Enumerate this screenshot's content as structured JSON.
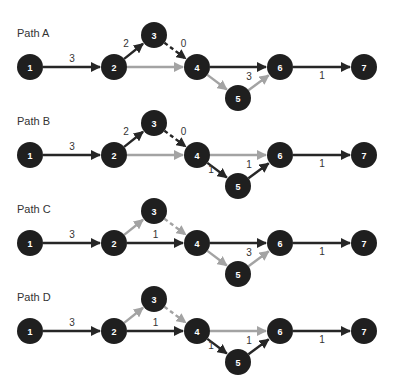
{
  "colors": {
    "node_fill": "#1f1f1f",
    "dark_edge": "#262626",
    "gray_edge": "#a3a3a3",
    "text": "#333333",
    "node_text": "#ffffff"
  },
  "layout": {
    "node_x": {
      "1": 30,
      "2": 114,
      "3": 154,
      "4": 197,
      "5": 238,
      "6": 280,
      "7": 364
    },
    "node_radius": 13,
    "panel_offsets": [
      0,
      88,
      176,
      264
    ],
    "main_row_y": 67,
    "upper_y": 35,
    "lower_y": 98,
    "title_x": 17,
    "title_y": 37
  },
  "panels": [
    {
      "title": "Path A",
      "nodes": [
        "1",
        "2",
        "3",
        "4",
        "5",
        "6",
        "7"
      ],
      "edges": [
        {
          "from": "1",
          "to": "2",
          "label": "3",
          "style": "dark",
          "label_pos": "above"
        },
        {
          "from": "2",
          "to": "3",
          "label": "2",
          "style": "dark",
          "label_pos": "left"
        },
        {
          "from": "3",
          "to": "4",
          "label": "0",
          "style": "dark-dashed",
          "label_pos": "right"
        },
        {
          "from": "2",
          "to": "4",
          "label": "",
          "style": "gray"
        },
        {
          "from": "4",
          "to": "6",
          "label": "",
          "style": "dark"
        },
        {
          "from": "4",
          "to": "5",
          "label": "",
          "style": "gray"
        },
        {
          "from": "5",
          "to": "6",
          "label": "3",
          "style": "gray",
          "label_pos": "left"
        },
        {
          "from": "6",
          "to": "7",
          "label": "1",
          "style": "dark",
          "label_pos": "below"
        }
      ]
    },
    {
      "title": "Path B",
      "nodes": [
        "1",
        "2",
        "3",
        "4",
        "5",
        "6",
        "7"
      ],
      "edges": [
        {
          "from": "1",
          "to": "2",
          "label": "3",
          "style": "dark",
          "label_pos": "above"
        },
        {
          "from": "2",
          "to": "3",
          "label": "2",
          "style": "dark",
          "label_pos": "left"
        },
        {
          "from": "3",
          "to": "4",
          "label": "0",
          "style": "dark-dashed",
          "label_pos": "right"
        },
        {
          "from": "2",
          "to": "4",
          "label": "",
          "style": "gray"
        },
        {
          "from": "4",
          "to": "6",
          "label": "",
          "style": "gray"
        },
        {
          "from": "4",
          "to": "5",
          "label": "1",
          "style": "dark",
          "label_pos": "right"
        },
        {
          "from": "5",
          "to": "6",
          "label": "1",
          "style": "dark",
          "label_pos": "left"
        },
        {
          "from": "6",
          "to": "7",
          "label": "1",
          "style": "dark",
          "label_pos": "below"
        }
      ]
    },
    {
      "title": "Path C",
      "nodes": [
        "1",
        "2",
        "3",
        "4",
        "5",
        "6",
        "7"
      ],
      "edges": [
        {
          "from": "1",
          "to": "2",
          "label": "3",
          "style": "dark",
          "label_pos": "above"
        },
        {
          "from": "2",
          "to": "3",
          "label": "",
          "style": "gray"
        },
        {
          "from": "3",
          "to": "4",
          "label": "",
          "style": "gray-dashed"
        },
        {
          "from": "2",
          "to": "4",
          "label": "1",
          "style": "dark",
          "label_pos": "above"
        },
        {
          "from": "4",
          "to": "6",
          "label": "",
          "style": "dark"
        },
        {
          "from": "4",
          "to": "5",
          "label": "",
          "style": "gray"
        },
        {
          "from": "5",
          "to": "6",
          "label": "3",
          "style": "gray",
          "label_pos": "left"
        },
        {
          "from": "6",
          "to": "7",
          "label": "1",
          "style": "dark",
          "label_pos": "below"
        }
      ]
    },
    {
      "title": "Path D",
      "nodes": [
        "1",
        "2",
        "3",
        "4",
        "5",
        "6",
        "7"
      ],
      "edges": [
        {
          "from": "1",
          "to": "2",
          "label": "3",
          "style": "dark",
          "label_pos": "above"
        },
        {
          "from": "2",
          "to": "3",
          "label": "",
          "style": "gray"
        },
        {
          "from": "3",
          "to": "4",
          "label": "",
          "style": "gray-dashed"
        },
        {
          "from": "2",
          "to": "4",
          "label": "1",
          "style": "dark",
          "label_pos": "above"
        },
        {
          "from": "4",
          "to": "6",
          "label": "",
          "style": "gray"
        },
        {
          "from": "4",
          "to": "5",
          "label": "1",
          "style": "dark",
          "label_pos": "right"
        },
        {
          "from": "5",
          "to": "6",
          "label": "1",
          "style": "dark",
          "label_pos": "left"
        },
        {
          "from": "6",
          "to": "7",
          "label": "1",
          "style": "dark",
          "label_pos": "below"
        }
      ]
    }
  ]
}
